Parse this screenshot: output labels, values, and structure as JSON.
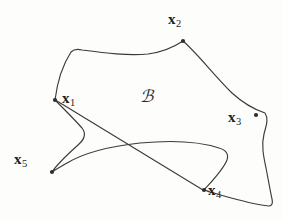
{
  "figure": {
    "kind": "region-with-marked-points-diagram",
    "background_color": "#fdfdfc",
    "stroke_color": "#3b3b3b",
    "label_color": "#1f1f1f",
    "width": 283,
    "height": 220,
    "set_label": {
      "text": "ℬ",
      "name": "region-label-B",
      "x": 140,
      "y": 88
    },
    "points": [
      {
        "id": "x1",
        "symbol": "x",
        "subscript": "1",
        "dot_x": 55,
        "dot_y": 100,
        "label_x": 62,
        "label_y": 91
      },
      {
        "id": "x2",
        "symbol": "x",
        "subscript": "2",
        "dot_x": 183,
        "dot_y": 41,
        "label_x": 168,
        "label_y": 12
      },
      {
        "id": "x3",
        "symbol": "x",
        "subscript": "3",
        "dot_x": 256,
        "dot_y": 115,
        "label_x": 228,
        "label_y": 110
      },
      {
        "id": "x4",
        "symbol": "x",
        "subscript": "4",
        "dot_x": 204,
        "dot_y": 190,
        "label_x": 208,
        "label_y": 183
      },
      {
        "id": "x5",
        "symbol": "x",
        "subscript": "5",
        "dot_x": 52,
        "dot_y": 172,
        "label_x": 14,
        "label_y": 152
      }
    ],
    "outline_path": "M 55 100 C 57 84 62 66 71 52 C 74 49 78 49 82 50 C 105 53 128 56 148 54 C 163 52 174 47 183 41 C 196 52 213 74 232 93 C 244 104 256 110 265 113 C 269 119 266 126 264 134 C 261 146 264 158 266 168 C 268 178 270 190 272 199 C 273 203 272 206 269 206 C 250 204 228 197 210 192 C 207 191 205 190 204 190 C 213 180 223 170 227 160 C 229 154 226 150 219 148 C 201 142 172 140 140 143 C 112 146 84 153 67 163 C 60 167 55 170 52 172 C 58 163 68 154 78 145 C 85 139 86 133 82 128 C 74 119 63 108 55 100 Z",
    "chord_path": "M 57 101 L 203 190"
  }
}
